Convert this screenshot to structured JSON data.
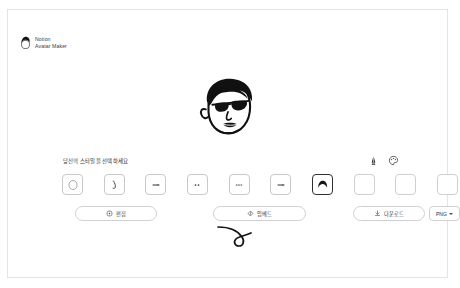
{
  "brand": {
    "icon": "notion-avatar-logo",
    "line1": "Notion",
    "line2": "Avatar Maker"
  },
  "avatar": {
    "name": "avatar-preview",
    "description": "cartoon face with dark hair and sunglasses",
    "hair_color": "#1a1a1a",
    "line_color": "#111111",
    "skin_color": "#ffffff"
  },
  "style_picker": {
    "title": "당신의 스타일을 선택하세요",
    "tools": [
      {
        "name": "brush-icon",
        "label": "brush"
      },
      {
        "name": "palette-icon",
        "label": "palette"
      }
    ],
    "tiles": [
      {
        "name": "tile-face",
        "icon": "face-shape-icon",
        "selected": false
      },
      {
        "name": "tile-nose",
        "icon": "nose-icon",
        "selected": false
      },
      {
        "name": "tile-mouth",
        "icon": "mouth-icon",
        "selected": false
      },
      {
        "name": "tile-eyes",
        "icon": "eyes-icon",
        "selected": false
      },
      {
        "name": "tile-eyebrows",
        "icon": "eyebrows-icon",
        "selected": false
      },
      {
        "name": "tile-glasses",
        "icon": "glasses-icon",
        "selected": false
      },
      {
        "name": "tile-hair",
        "icon": "hair-icon",
        "selected": true
      },
      {
        "name": "tile-accessory",
        "icon": "blank-icon",
        "selected": false
      },
      {
        "name": "tile-detail",
        "icon": "blank-icon",
        "selected": false
      },
      {
        "name": "tile-beard",
        "icon": "blank-icon",
        "selected": false
      }
    ]
  },
  "actions": {
    "edit": {
      "label": "편집",
      "icon": "dice-icon"
    },
    "embed": {
      "label": "임베드",
      "icon": "code-icon"
    },
    "download": {
      "label": "다운로드",
      "icon": "download-icon"
    },
    "format": {
      "value": "PNG",
      "icon": "chevron-down-icon"
    }
  },
  "decoration": {
    "flourish": "curl-swirl-line"
  },
  "colors": {
    "ink": "#111111",
    "border": "#d0d0d0",
    "frame": "#e4e4e4",
    "selected_border": "#2f2f2f"
  }
}
